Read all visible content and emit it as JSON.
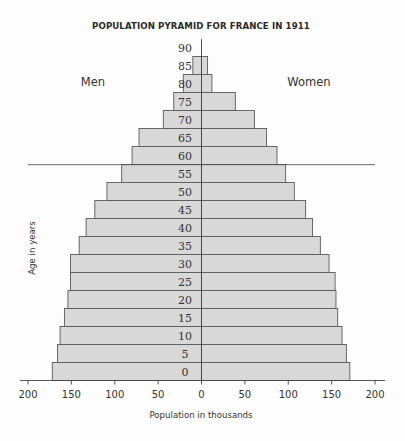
{
  "chart_data": {
    "type": "bar",
    "orientation": "horizontal-pyramid",
    "title": "POPULATION PYRAMID FOR FRANCE IN 1911",
    "xlabel": "Population in thousands",
    "ylabel": "Age in years",
    "left_label": "Men",
    "right_label": "Women",
    "xlim": [
      -200,
      200
    ],
    "x_ticks": [
      200,
      150,
      100,
      50,
      0,
      50,
      100,
      150,
      200
    ],
    "x_tick_values": [
      -200,
      -150,
      -100,
      -50,
      0,
      50,
      100,
      150,
      200
    ],
    "categories": [
      "0",
      "5",
      "10",
      "15",
      "20",
      "25",
      "30",
      "35",
      "40",
      "45",
      "50",
      "55",
      "60",
      "65",
      "70",
      "75",
      "80",
      "85"
    ],
    "top_age_label": "90",
    "series": [
      {
        "name": "Men",
        "side": "left",
        "values": [
          172,
          166,
          163,
          158,
          154,
          151,
          151,
          141,
          133,
          123,
          109,
          92,
          80,
          72,
          44,
          32,
          21,
          10
        ]
      },
      {
        "name": "Women",
        "side": "right",
        "values": [
          171,
          167,
          162,
          157,
          155,
          154,
          147,
          137,
          128,
          120,
          107,
          97,
          87,
          75,
          61,
          39,
          12,
          7
        ]
      }
    ],
    "annotation_line": {
      "between_ages": [
        "55",
        "60"
      ],
      "description": "horizontal reference line"
    },
    "grid": false,
    "colors": {
      "bar_fill": "#d8d8d8",
      "bar_stroke": "#5a5a5a",
      "axis": "#444444"
    }
  }
}
